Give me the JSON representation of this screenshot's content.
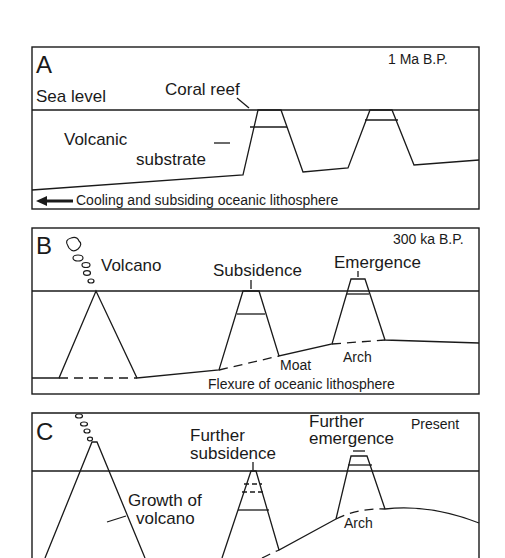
{
  "panels": [
    {
      "letter": "A",
      "age": "1 Ma  B.P.",
      "labels": {
        "sea_level": "Sea level",
        "coral_reef": "Coral reef",
        "volcanic": "Volcanic",
        "substrate": "substrate",
        "lithosphere": "Cooling and subsiding oceanic lithosphere"
      }
    },
    {
      "letter": "B",
      "age": "300 ka B.P.",
      "labels": {
        "volcano": "Volcano",
        "subsidence": "Subsidence",
        "emergence": "Emergence",
        "moat": "Moat",
        "arch": "Arch",
        "lithosphere": "Flexure of oceanic lithosphere"
      }
    },
    {
      "letter": "C",
      "age": "Present",
      "labels": {
        "further_subsidence_1": "Further",
        "further_subsidence_2": "subsidence",
        "further_emergence_1": "Further",
        "further_emergence_2": "emergence",
        "growth_1": "Growth of",
        "growth_2": "volcano",
        "arch": "Arch"
      }
    }
  ],
  "colors": {
    "ink": "#1a1a1a",
    "background": "#ffffff"
  }
}
